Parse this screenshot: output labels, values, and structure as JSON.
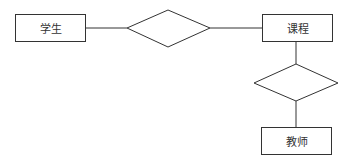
{
  "diagram": {
    "type": "er-diagram",
    "entities": [
      {
        "id": "student",
        "label": "学生"
      },
      {
        "id": "course",
        "label": "课程"
      },
      {
        "id": "teacher",
        "label": "教师"
      }
    ],
    "relationships": [
      {
        "id": "rel1",
        "label": "",
        "connects": [
          "student",
          "course"
        ]
      },
      {
        "id": "rel2",
        "label": "",
        "connects": [
          "course",
          "teacher"
        ]
      }
    ],
    "colors": {
      "stroke": "#333333",
      "background": "#ffffff",
      "text": "#333333"
    }
  }
}
